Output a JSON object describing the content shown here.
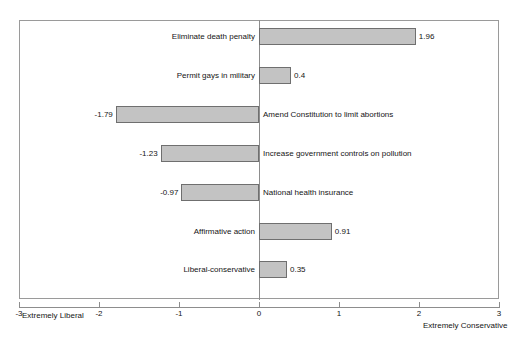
{
  "chart_data": {
    "type": "bar",
    "orientation": "horizontal",
    "title": "",
    "subtitle": "",
    "xlabel": "",
    "ylabel": "",
    "xlim": [
      -3,
      3
    ],
    "xticks": [
      "-3",
      "-2",
      "-1",
      "0",
      "1",
      "2",
      "3"
    ],
    "grid": false,
    "legend": null,
    "axis_endpoint_labels": {
      "left": "Extremely Liberal",
      "right": "Extremely Conservative"
    },
    "categories": [
      "Eliminate death penalty",
      "Permit gays in military",
      "Amend Constitution to limit abortions",
      "Increase government controls on pollution",
      "National health insurance",
      "Affirmative action",
      "Liberal-conservative"
    ],
    "values": [
      1.96,
      0.4,
      -1.79,
      -1.23,
      -0.97,
      0.91,
      0.35
    ],
    "value_labels": [
      "1.96",
      "0.4",
      "-1.79",
      "-1.23",
      "-0.97",
      "0.91",
      "0.35"
    ],
    "bars": [
      {
        "label": "Eliminate death penalty",
        "value": 1.96,
        "value_text": "1.96"
      },
      {
        "label": "Permit gays in military",
        "value": 0.4,
        "value_text": "0.4"
      },
      {
        "label": "Amend Constitution to limit abortions",
        "value": -1.79,
        "value_text": "-1.79"
      },
      {
        "label": "Increase government controls on pollution",
        "value": -1.23,
        "value_text": "-1.23"
      },
      {
        "label": "National health insurance",
        "value": -0.97,
        "value_text": "-0.97"
      },
      {
        "label": "Affirmative action",
        "value": 0.91,
        "value_text": "0.91"
      },
      {
        "label": "Liberal-conservative",
        "value": 0.35,
        "value_text": "0.35"
      }
    ],
    "colors": {
      "bar_fill": "#c3c3c3",
      "bar_border": "#6f6f6f",
      "frame": "#9a9a9a",
      "axis": "#8d8d8d",
      "text": "#151515",
      "background": "#ffffff"
    }
  }
}
